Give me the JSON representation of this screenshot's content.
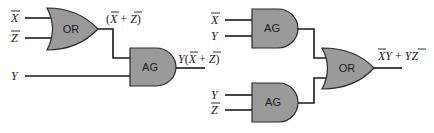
{
  "diagram": {
    "type": "logic-circuit",
    "colors": {
      "gate_fill": "#9a9a9a",
      "wire": "#1a1a1a",
      "background": "#ffffff"
    },
    "left_circuit": {
      "inputs": [
        {
          "name": "X",
          "negated": true,
          "label": "X"
        },
        {
          "name": "Z",
          "negated": true,
          "label": "Z"
        },
        {
          "name": "Y",
          "negated": false,
          "label": "Y"
        }
      ],
      "gates": [
        {
          "id": "or1",
          "type": "OR",
          "label": "OR",
          "inputs": [
            "X̄",
            "Z̄"
          ]
        },
        {
          "id": "and1",
          "type": "AND",
          "label": "AG",
          "inputs": [
            "or1",
            "Y"
          ]
        }
      ],
      "intermediate_label": {
        "open": "(",
        "x": "X",
        "plus": " + ",
        "z": "Z",
        "close": ")"
      },
      "output_label": {
        "y": "Y",
        "open": "(",
        "x": "X",
        "plus": " + ",
        "z": "Z",
        "close": ")"
      }
    },
    "right_circuit": {
      "inputs_top": [
        {
          "name": "X",
          "negated": true,
          "label": "X"
        },
        {
          "name": "Y",
          "negated": false,
          "label": "Y"
        }
      ],
      "inputs_bottom": [
        {
          "name": "Y",
          "negated": false,
          "label": "Y"
        },
        {
          "name": "Z",
          "negated": true,
          "label": "Z"
        }
      ],
      "gates": [
        {
          "id": "and_top",
          "type": "AND",
          "label": "AG",
          "inputs": [
            "X̄",
            "Y"
          ]
        },
        {
          "id": "and_bottom",
          "type": "AND",
          "label": "AG",
          "inputs": [
            "Y",
            "Z̄"
          ]
        },
        {
          "id": "or2",
          "type": "OR",
          "label": "OR",
          "inputs": [
            "and_top",
            "and_bottom"
          ]
        }
      ],
      "output_label": {
        "x": "X",
        "y1": "Y",
        "plus": " + ",
        "y2": "Y",
        "z": "Z"
      }
    }
  }
}
